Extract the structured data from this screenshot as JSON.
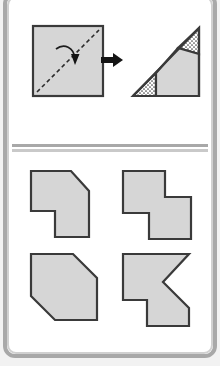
{
  "figure": {
    "panels": [
      {
        "id": "prompt",
        "name": "fold-prompt-panel",
        "description": "A square sheet is folded along its diagonal to produce a right triangle",
        "items": [
          {
            "id": "source-square",
            "label": "square sheet",
            "shape": "square"
          },
          {
            "id": "fold-line",
            "label": "diagonal fold line",
            "shape": "dashed-diagonal"
          },
          {
            "id": "fold-arrow",
            "label": "fold direction arrow",
            "shape": "curved-arrow"
          },
          {
            "id": "transform-arrow",
            "label": "becomes",
            "shape": "right-arrow"
          },
          {
            "id": "result-triangle",
            "label": "folded right triangle",
            "shape": "triangle"
          }
        ]
      },
      {
        "id": "options",
        "name": "answer-options-panel",
        "description": "Four candidate unfolded shapes",
        "items": [
          {
            "id": "option-a",
            "label": "A",
            "shape": "notched-hexagon-cut-top-right"
          },
          {
            "id": "option-b",
            "label": "B",
            "shape": "z-step-polygon"
          },
          {
            "id": "option-c",
            "label": "C",
            "shape": "hexagon-two-cut-corners"
          },
          {
            "id": "option-d",
            "label": "D",
            "shape": "chevron-notched-polygon"
          }
        ]
      }
    ]
  },
  "colors": {
    "shape_fill": "#d6d6d6",
    "shape_stroke": "#3a3a3a",
    "frame_outer": "#a8a8a8",
    "frame_inner": "#d0d0d0",
    "page_background": "#ffffff",
    "ink": "#141414",
    "stipple_background": "#ffffff"
  },
  "chart_data": {
    "type": "diagram",
    "prompt": {
      "square": {
        "x": 0,
        "y": 0,
        "w": 68,
        "h": 68
      },
      "fold_axis": "bottom-left to top-right diagonal",
      "result": "right triangle with right angle at bottom-right"
    },
    "options": [
      {
        "key": "A",
        "points": "6,6 46,6 64,26 64,72 30,72 30,46 6,46"
      },
      {
        "key": "B",
        "points": "6,6 48,6 48,32 74,32 74,74 32,74 32,48 6,48"
      },
      {
        "key": "C",
        "points": "6,6 48,6 72,30 72,72 30,72 6,48"
      },
      {
        "key": "D",
        "points": "6,6 72,6 46,34 72,60 72,78 30,78 30,52 6,52"
      }
    ]
  }
}
